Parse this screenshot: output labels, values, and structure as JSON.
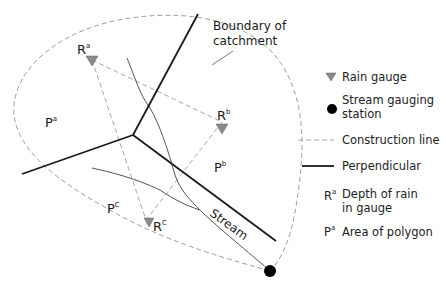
{
  "diagram": {
    "annotation": {
      "line1": "Boundary of",
      "line2": "catchment"
    },
    "gauges": [
      {
        "id": "a",
        "label": "R",
        "sup": "a"
      },
      {
        "id": "b",
        "label": "R",
        "sup": "b"
      },
      {
        "id": "c",
        "label": "R",
        "sup": "C"
      }
    ],
    "polygons": [
      {
        "id": "a",
        "label": "P",
        "sup": "a"
      },
      {
        "id": "b",
        "label": "P",
        "sup": "b"
      },
      {
        "id": "c",
        "label": "P",
        "sup": "C"
      }
    ],
    "stream_label": "Stream"
  },
  "legend": {
    "rain_gauge": "Rain gauge",
    "station_line1": "Stream gauging",
    "station_line2": "station",
    "construction": "Construction line",
    "perpendicular": "Perpendicular",
    "depth_symbol": "R",
    "depth_sup": "a",
    "depth_line1": "Depth of rain",
    "depth_line2": "in gauge",
    "area_symbol": "P",
    "area_sup": "a",
    "area_text": "Area of polygon"
  },
  "colors": {
    "boundary": "#9a9a9a",
    "construction": "#a8a8a8",
    "perpendicular": "#1a1a1a",
    "stream": "#555555",
    "gauge_fill": "#8a8a8a",
    "station": "#000000"
  }
}
